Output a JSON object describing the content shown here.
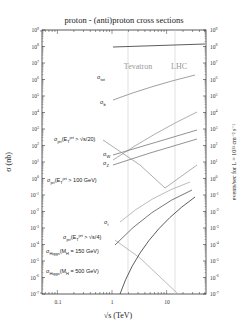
{
  "chart_data": {
    "type": "line",
    "title": "proton - (anti)proton cross sections",
    "xlabel": "√s (TeV)",
    "ylabel": "σ (nb)",
    "ylabel_right": "events/sec for L = 10^33 cm^-2 s^-1",
    "xscale": "log",
    "yscale": "log",
    "xlim": [
      0.05,
      50
    ],
    "ylim": [
      1e-07,
      1000000000.0
    ],
    "x_ticks": [
      "0.1",
      "1",
      "10"
    ],
    "y_ticks": [
      "10^9",
      "10^8",
      "10^7",
      "10^6",
      "10^5",
      "10^4",
      "10^3",
      "10^2",
      "10^1",
      "10^0",
      "10^-1",
      "10^-2",
      "10^-3",
      "10^-4",
      "10^-5",
      "10^-6",
      "10^-7"
    ],
    "y_ticks_right": [
      "10^9",
      "10^8",
      "10^7",
      "10^6",
      "10^5",
      "10^4",
      "10^3",
      "10^2",
      "10^1",
      "10^0",
      "10^-1",
      "10^-2",
      "10^-3",
      "10^-4",
      "10^-5",
      "10^-6",
      "10^-7"
    ],
    "annotations": [
      {
        "text": "Tevatron",
        "x": 1.96
      },
      {
        "text": "LHC",
        "x": 14
      }
    ],
    "series": [
      {
        "name": "σ_tot",
        "x": [
          1.0,
          2.0,
          5.0,
          14.0,
          40.0
        ],
        "values": [
          70000000.0,
          76000000.0,
          85000000.0,
          100000000.0,
          110000000.0
        ]
      },
      {
        "name": "σ_b",
        "x": [
          1.0,
          2.0,
          5.0,
          14.0,
          30.0
        ],
        "values": [
          60000.0,
          120000.0,
          400000.0,
          1200000.0,
          2000000.0
        ]
      },
      {
        "name": "σ_jet(E_T^jet > √s/20)",
        "x": [
          1.0,
          2.0,
          5.0,
          14.0,
          30.0
        ],
        "values": [
          15.0,
          40.0,
          200.0,
          1500.0,
          8000.0
        ]
      },
      {
        "name": "σ_W",
        "x": [
          1.0,
          2.0,
          5.0,
          14.0,
          30.0
        ],
        "values": [
          40.0,
          60.0,
          150.0,
          400.0,
          1500.0
        ]
      },
      {
        "name": "σ_Z",
        "x": [
          1.0,
          2.0,
          5.0,
          14.0,
          30.0
        ],
        "values": [
          10.0,
          18.0,
          40.0,
          120.0,
          300.0
        ]
      },
      {
        "name": "σ_jet(E_T^jet > 100 GeV)",
        "x": [
          0.8,
          2.0,
          5.0,
          10.0,
          14.0,
          30.0
        ],
        "values": [
          300.0,
          20.0,
          1.5,
          0.1,
          0.1,
          20.0
        ]
      },
      {
        "name": "σ_t",
        "x": [
          1.0,
          2.0,
          5.0,
          14.0,
          30.0
        ],
        "values": [
          0.001,
          0.006,
          0.1,
          0.8,
          3.0
        ]
      },
      {
        "name": "σ_jet(E_T^jet > √s/4)",
        "x": [
          1.0,
          2.0,
          5.0,
          14.0
        ],
        "values": [
          0.001,
          0.0001,
          3e-06,
          1e-07
        ]
      },
      {
        "name": "σ_Higgs(M_H = 150 GeV)",
        "x": [
          1.0,
          2.0,
          5.0,
          14.0,
          30.0
        ],
        "values": [
          0.0001,
          0.001,
          0.01,
          0.04,
          0.1
        ]
      },
      {
        "name": "σ_Higgs(M_H = 500 GeV)",
        "x": [
          1.0,
          2.0,
          5.0,
          14.0,
          30.0
        ],
        "values": [
          1e-07,
          3e-06,
          0.0001,
          0.001,
          0.01
        ]
      }
    ],
    "grid": false,
    "legend": "inline labels"
  },
  "labels": {
    "title": "proton - (anti)proton cross sections",
    "xlabel": "√s   (TeV)",
    "ylabel": "σ  (nb)",
    "ylabel_right": "events/sec for  L = 10³³ cm⁻² s⁻¹",
    "tevatron": "Tevatron",
    "lhc": "LHC",
    "x_ticks": [
      "0.1",
      "1",
      "10"
    ],
    "curve_labels": {
      "tot": "σ",
      "tot_sub": "tot",
      "b": "σ",
      "b_sub": "b",
      "jet20": "σ",
      "jet20_sub": "jet",
      "jet20_rest": "(E",
      "jet20_T": "T",
      "jet20_sup": "jet",
      "jet20_cond": " > √s/20)",
      "w": "σ",
      "w_sub": "W",
      "z": "σ",
      "z_sub": "Z",
      "jet100": "σ",
      "jet100_sub": "jet",
      "jet100_rest": "(E",
      "jet100_T": "T",
      "jet100_sup": "jet",
      "jet100_cond": " > 100 GeV)",
      "t": "σ",
      "t_sub": "t",
      "jet4": "σ",
      "jet4_sub": "jet",
      "jet4_rest": "(E",
      "jet4_T": "T",
      "jet4_sup": "jet",
      "jet4_cond": " > √s/4)",
      "h150": "σ",
      "h150_sub": "Higgs",
      "h150_cond": "(M",
      "h150_H": "H",
      "h150_val": " = 150 GeV)",
      "h500": "σ",
      "h500_sub": "Higgs",
      "h500_cond": "(M",
      "h500_H": "H",
      "h500_val": " = 500 GeV)"
    }
  }
}
